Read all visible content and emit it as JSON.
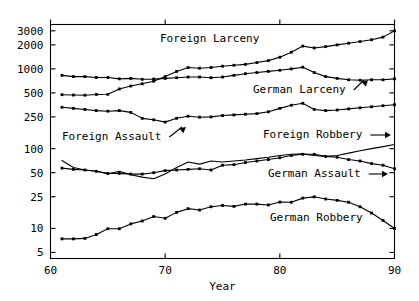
{
  "chart_data": {
    "type": "line",
    "title": "",
    "xlabel": "Year",
    "ylabel": "",
    "yscale": "log",
    "xlim": [
      60,
      90
    ],
    "ylim": [
      4.2,
      3600
    ],
    "grid": false,
    "legend_position": "inline-annotations",
    "xticks": [
      60,
      70,
      80,
      90
    ],
    "xtick_labels": [
      "60",
      "70",
      "80",
      "90"
    ],
    "yticks": [
      5,
      10,
      25,
      50,
      100,
      250,
      500,
      1000,
      2000,
      3000
    ],
    "ytick_labels": [
      "5",
      "10",
      "25",
      "50",
      "100",
      "250",
      "500",
      "1000",
      "2000",
      "3000"
    ],
    "x": [
      61,
      62,
      63,
      64,
      65,
      66,
      67,
      68,
      69,
      70,
      71,
      72,
      73,
      74,
      75,
      76,
      77,
      78,
      79,
      80,
      81,
      82,
      83,
      84,
      85,
      86,
      87,
      88,
      89,
      90
    ],
    "series": [
      {
        "name": "Foreign Larceny",
        "markers": true,
        "values": [
          475,
          470,
          468,
          478,
          480,
          560,
          610,
          650,
          700,
          800,
          930,
          1040,
          1020,
          1040,
          1080,
          1110,
          1140,
          1200,
          1270,
          1400,
          1620,
          1930,
          1830,
          1900,
          2000,
          2100,
          2200,
          2320,
          2500,
          3000
        ]
      },
      {
        "name": "German Larceny",
        "markers": true,
        "values": [
          830,
          800,
          800,
          780,
          780,
          750,
          760,
          740,
          745,
          760,
          775,
          790,
          790,
          775,
          790,
          830,
          870,
          900,
          930,
          960,
          1000,
          1050,
          900,
          800,
          760,
          730,
          720,
          730,
          730,
          750
        ]
      },
      {
        "name": "Foreign Assault",
        "markers": true,
        "values": [
          330,
          320,
          310,
          300,
          295,
          300,
          285,
          240,
          230,
          215,
          240,
          255,
          248,
          250,
          260,
          265,
          270,
          275,
          290,
          320,
          350,
          370,
          310,
          300,
          305,
          315,
          325,
          335,
          345,
          355
        ]
      },
      {
        "name": "German Assault",
        "markers": true,
        "values": [
          57,
          55,
          54,
          52,
          49,
          49,
          48,
          48,
          50,
          53,
          54,
          55,
          56,
          54,
          62,
          63,
          67,
          70,
          73,
          77,
          82,
          85,
          85,
          80,
          78,
          73,
          70,
          65,
          62,
          56
        ]
      },
      {
        "name": "Foreign Robbery",
        "markers": false,
        "values": [
          71,
          58,
          54,
          52,
          48,
          52,
          47,
          44,
          42,
          48,
          58,
          68,
          64,
          70,
          68,
          70,
          72,
          75,
          78,
          82,
          85,
          86,
          82,
          80,
          82,
          88,
          94,
          100,
          106,
          113
        ]
      },
      {
        "name": "German Robbery",
        "markers": true,
        "values": [
          7.4,
          7.4,
          7.5,
          8.4,
          9.9,
          9.9,
          11.4,
          12.4,
          14.1,
          13.4,
          15.9,
          17.7,
          17.0,
          18.7,
          19.4,
          18.9,
          20.2,
          20.2,
          19.7,
          21.4,
          21.3,
          24.0,
          24.9,
          23.4,
          22.5,
          21.3,
          18.7,
          15.6,
          12.6,
          10.0
        ]
      }
    ],
    "annotations": [
      {
        "label": "Foreign Larceny",
        "x_px": 160,
        "y_px": 42,
        "arrow": false
      },
      {
        "label": "German Larceny",
        "x_px": 253,
        "y_px": 93,
        "arrow": true,
        "arrow_to_x": 368,
        "arrow_to_y": 80
      },
      {
        "label": "Foreign Assault",
        "x_px": 62,
        "y_px": 140,
        "arrow": true,
        "arrow_to_x": 186,
        "arrow_to_y": 127
      },
      {
        "label": "Foreign Robbery",
        "x_px": 263,
        "y_px": 138,
        "arrow": true,
        "arrow_to_x": 391,
        "arrow_to_y": 135
      },
      {
        "label": "German Assault",
        "x_px": 268,
        "y_px": 177,
        "arrow": true,
        "arrow_to_x": 388,
        "arrow_to_y": 174
      },
      {
        "label": "German Robbery",
        "x_px": 270,
        "y_px": 221,
        "arrow": false
      }
    ],
    "colors": {
      "line": "#000000",
      "marker": "#000000",
      "axis": "#000000",
      "background": "#ffffff",
      "text": "#000000"
    }
  }
}
